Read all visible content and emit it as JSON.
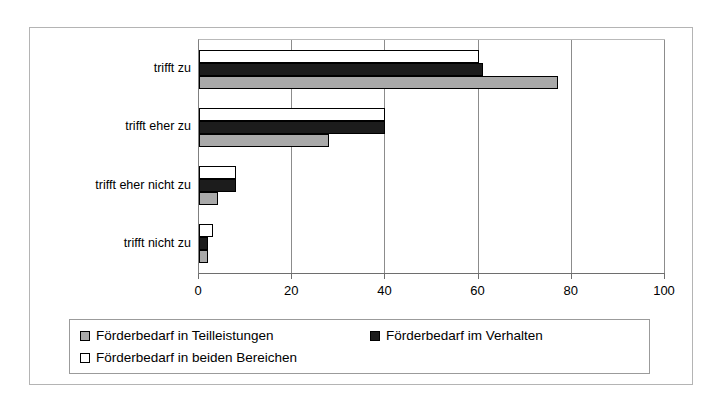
{
  "chart_data": {
    "type": "bar",
    "orientation": "horizontal",
    "title": "",
    "xlabel": "",
    "ylabel": "",
    "xlim": [
      0,
      100
    ],
    "xticks": [
      0,
      20,
      40,
      60,
      80,
      100
    ],
    "xtick_labels": [
      "0",
      "20",
      "40",
      "60",
      "80",
      "100"
    ],
    "grid": true,
    "grid_axis": "x",
    "legend_position": "bottom",
    "categories": [
      "trifft zu",
      "trifft eher zu",
      "trifft eher nicht zu",
      "trifft nicht zu"
    ],
    "series": [
      {
        "name": "Förderbedarf in Teilleistungen",
        "color": "#a9a9a9",
        "values": [
          77,
          28,
          4,
          2
        ]
      },
      {
        "name": "Förderbedarf im Verhalten",
        "color": "#1c1c1c",
        "values": [
          61,
          40,
          8,
          2
        ]
      },
      {
        "name": "Förderbedarf in beiden Bereichen",
        "color": "#ffffff",
        "values": [
          60,
          40,
          8,
          3
        ]
      }
    ]
  },
  "legend": {
    "items": [
      {
        "label": "Förderbedarf in Teilleistungen",
        "swatch": "gray"
      },
      {
        "label": "Förderbedarf im Verhalten",
        "swatch": "black"
      },
      {
        "label": "Förderbedarf in beiden Bereichen",
        "swatch": "white"
      }
    ]
  },
  "axis": {
    "x_tick_labels": [
      "0",
      "20",
      "40",
      "60",
      "80",
      "100"
    ]
  },
  "colors": {
    "series_teilleistungen": "#a9a9a9",
    "series_verhalten": "#1c1c1c",
    "series_beide": "#ffffff",
    "frame_border": "#b4b4b4",
    "gridline": "#8c8c8c",
    "axis": "#6e6e6e"
  }
}
